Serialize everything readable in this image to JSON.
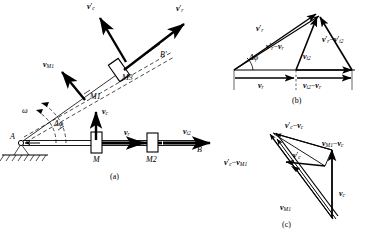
{
  "figure": {
    "panels": [
      {
        "key": "a",
        "caption": "(a)",
        "caption_x": 110,
        "caption_y": 172
      },
      {
        "key": "b",
        "caption": "(b)",
        "caption_x": 292,
        "caption_y": 96
      },
      {
        "key": "c",
        "caption": "(c)",
        "caption_x": 282,
        "caption_y": 222
      }
    ]
  },
  "panel_a": {
    "points": [
      {
        "name": "A",
        "label": "A",
        "x": 10,
        "y": 137
      },
      {
        "name": "B",
        "label": "B",
        "x": 197,
        "y": 150
      },
      {
        "name": "B-prime",
        "label": "B′",
        "x": 160,
        "y": 55
      },
      {
        "name": "M",
        "label": "M",
        "x": 96,
        "y": 160
      },
      {
        "name": "M1",
        "label": "M1",
        "x": 93,
        "y": 97
      },
      {
        "name": "M2",
        "label": "M2",
        "x": 152,
        "y": 160
      },
      {
        "name": "M3",
        "label": "M3",
        "x": 125,
        "y": 77
      }
    ],
    "angles": [
      {
        "name": "omega",
        "label": "ω",
        "x": 22,
        "y": 111
      },
      {
        "name": "delta-phi",
        "label": "Δφ",
        "x": 55,
        "y": 124
      }
    ],
    "vectors": [
      {
        "name": "v-c-prime",
        "label": "v′c",
        "x": 88,
        "y": 6
      },
      {
        "name": "v-r-prime",
        "label": "v′r",
        "x": 176,
        "y": 8
      },
      {
        "name": "v-M1",
        "label": "vM1",
        "x": 48,
        "y": 65
      },
      {
        "name": "v-c",
        "label": "vc",
        "x": 106,
        "y": 111
      },
      {
        "name": "v-r",
        "label": "vr",
        "x": 125,
        "y": 133
      },
      {
        "name": "v-t2",
        "label": "vt2",
        "x": 184,
        "y": 132
      }
    ]
  },
  "panel_b": {
    "vectors": [
      {
        "name": "v-r-prime",
        "label": "v′r",
        "x": 256,
        "y": 28
      },
      {
        "name": "v-r-prime-minus-v-r",
        "label": "v′r − vr",
        "x": 272,
        "y": 45
      },
      {
        "name": "v-r-prime-minus-v-t2",
        "label": "v′r − v′t2",
        "x": 326,
        "y": 38
      },
      {
        "name": "v-t2",
        "label": "vt2",
        "x": 305,
        "y": 56
      },
      {
        "name": "delta-phi",
        "label": "Δφ",
        "x": 252,
        "y": 56
      },
      {
        "name": "v-r",
        "label": "vr",
        "x": 259,
        "y": 84
      },
      {
        "name": "v-t2-minus-v-r",
        "label": "vt2 − vr",
        "x": 307,
        "y": 84
      }
    ]
  },
  "panel_c": {
    "vectors": [
      {
        "name": "v-c-prime-minus-v-c",
        "label": "v′c − vc",
        "x": 288,
        "y": 125
      },
      {
        "name": "v-c-prime",
        "label": "v′c",
        "x": 294,
        "y": 156
      },
      {
        "name": "v-M1-minus-v-c",
        "label": "vM1 − vc",
        "x": 325,
        "y": 143
      },
      {
        "name": "v-c-prime-minus-v-M1",
        "label": "v′c − vM1",
        "x": 228,
        "y": 162
      },
      {
        "name": "v-M1",
        "label": "vM1",
        "x": 283,
        "y": 207
      },
      {
        "name": "v-c",
        "label": "vc",
        "x": 340,
        "y": 193
      }
    ]
  },
  "colors": {
    "ink": "#000000",
    "paper": "#ffffff",
    "hatch": "#000000"
  }
}
